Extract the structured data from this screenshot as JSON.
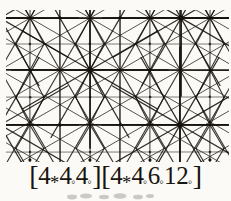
{
  "figure": {
    "name": "tiling-figure",
    "background_color": "#fbfaf6",
    "ink_color": "#16120d",
    "caption": {
      "full_text": "[4*4o4o][4*4o6o12o]",
      "groups": [
        {
          "open_bracket": "[",
          "terms": [
            {
              "number": "4",
              "mark": "*"
            },
            {
              "number": "4",
              "mark": "◦"
            },
            {
              "number": "4",
              "mark": "◦"
            }
          ],
          "close_bracket": "]"
        },
        {
          "open_bracket": "[",
          "terms": [
            {
              "number": "4",
              "mark": "*"
            },
            {
              "number": "4",
              "mark": "◦"
            },
            {
              "number": "6",
              "mark": "◦"
            },
            {
              "number": "12",
              "mark": "◦"
            }
          ],
          "close_bracket": "]"
        }
      ]
    },
    "pattern": {
      "description": "12-fold radiating star hubs on a triangular lattice",
      "hub_spokes": 12,
      "hub_spoke_step_degrees": 30,
      "lattice_rows_y": [
        18,
        70,
        125
      ],
      "lattice_step_x": 60,
      "hubs": [
        {
          "x": 90,
          "y": 70
        },
        {
          "x": 180,
          "y": 125
        },
        {
          "x": 181,
          "y": 18
        },
        {
          "x": 0,
          "y": 125
        },
        {
          "x": 0,
          "y": 18
        }
      ],
      "minor_nodes": [
        {
          "x": 30,
          "y": 70
        },
        {
          "x": 150,
          "y": 70
        },
        {
          "x": 210,
          "y": 70
        },
        {
          "x": 60,
          "y": 18
        },
        {
          "x": 120,
          "y": 18
        },
        {
          "x": 60,
          "y": 125
        },
        {
          "x": 120,
          "y": 125
        },
        {
          "x": 30,
          "y": 160
        },
        {
          "x": 90,
          "y": 160
        },
        {
          "x": 150,
          "y": 160
        },
        {
          "x": 210,
          "y": 160
        }
      ]
    }
  }
}
